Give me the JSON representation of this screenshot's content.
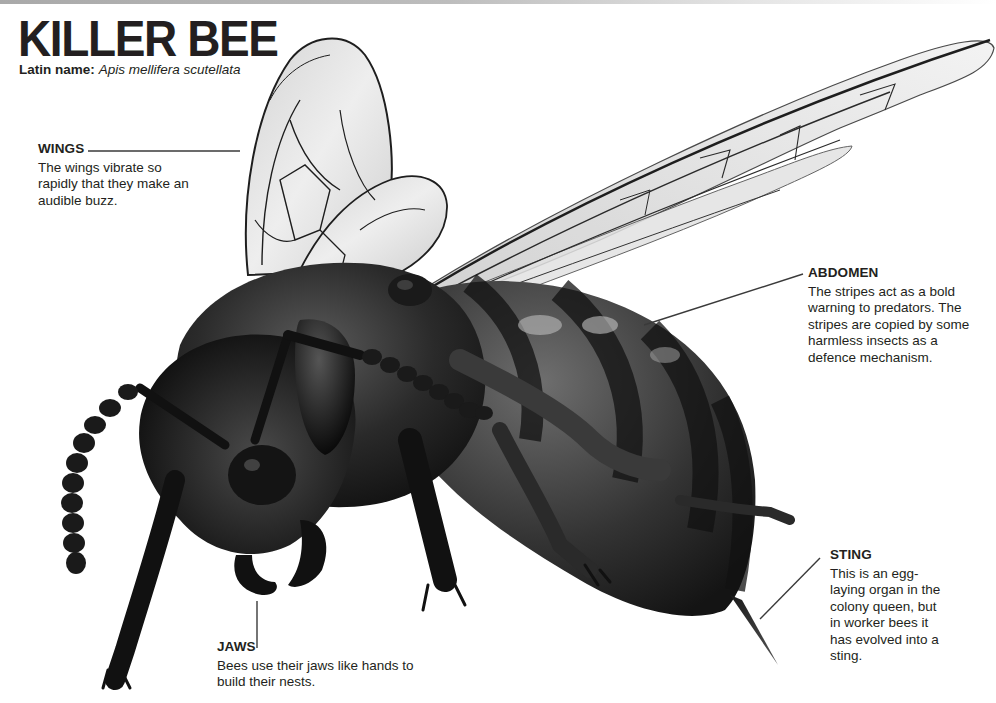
{
  "header": {
    "title": "KILLER BEE",
    "latin_label": "Latin name:",
    "latin_value": "Apis mellifera scutellata"
  },
  "callouts": {
    "wings": {
      "heading": "WINGS",
      "text": "The wings vibrate so rapidly that they make an audible buzz."
    },
    "abdomen": {
      "heading": "ABDOMEN",
      "text": "The stripes act as a bold warning to predators. The stripes are copied by some harmless insects as a defence mechanism."
    },
    "sting": {
      "heading": "STING",
      "text": "This is an egg-laying organ in the colony queen, but in worker bees it has evolved into a sting."
    },
    "jaws": {
      "heading": "JAWS",
      "text": "Bees use their jaws like hands to build their nests."
    }
  },
  "illustration": {
    "subject": "killer-bee-illustration",
    "colors": {
      "body": "#1c1c1c",
      "body_mid": "#3a3a3a",
      "stripe_light": "#8a8a8a",
      "wing_fill": "#e6e6e6",
      "wing_vein": "#2a2a2a",
      "leader_line": "#3a3a3a",
      "text": "#231f20"
    }
  }
}
